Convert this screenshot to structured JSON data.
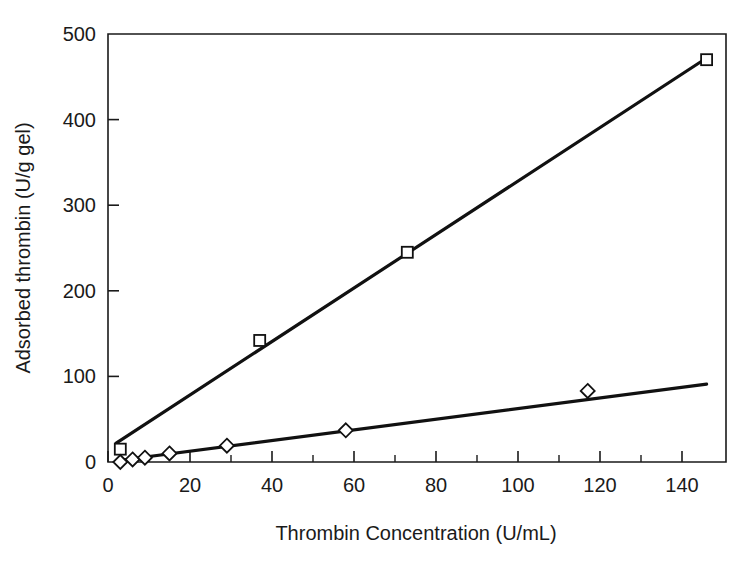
{
  "chart_data": {
    "type": "scatter",
    "title": "",
    "subtitle": "",
    "xlabel": "Thrombin Concentration (U/mL)",
    "ylabel": "Adsorbed thrombin (U/g gel)",
    "xlim": [
      0,
      150
    ],
    "ylim": [
      0,
      500
    ],
    "xticks": [
      0,
      20,
      40,
      60,
      80,
      100,
      120,
      140
    ],
    "yticks": [
      0,
      100,
      200,
      300,
      400,
      500
    ],
    "xtick_labels": [
      "0",
      "20",
      "40",
      "60",
      "80",
      "100",
      "120",
      "140"
    ],
    "ytick_labels": [
      "0",
      "100",
      "200",
      "300",
      "400",
      "500"
    ],
    "x_minor_tick_interval": 10,
    "grid": false,
    "legend": "none",
    "legend_position": "none",
    "annotations": [],
    "series": [
      {
        "name": "square-series",
        "marker": "open-square",
        "color": "#111111",
        "points": [
          {
            "x": 3,
            "y": 15
          },
          {
            "x": 37,
            "y": 142
          },
          {
            "x": 73,
            "y": 245
          },
          {
            "x": 146,
            "y": 470
          }
        ],
        "fit_line": {
          "x1": 2,
          "y1": 22,
          "x2": 146,
          "y2": 472
        }
      },
      {
        "name": "diamond-series",
        "marker": "open-diamond",
        "color": "#111111",
        "points": [
          {
            "x": 3,
            "y": 0
          },
          {
            "x": 6,
            "y": 3
          },
          {
            "x": 9,
            "y": 5
          },
          {
            "x": 15,
            "y": 10
          },
          {
            "x": 29,
            "y": 19
          },
          {
            "x": 58,
            "y": 37
          },
          {
            "x": 117,
            "y": 83
          }
        ],
        "fit_line": {
          "x1": 3,
          "y1": 2,
          "x2": 146,
          "y2": 91
        }
      }
    ]
  },
  "axes": {
    "x_title": "Thrombin Concentration (U/mL)",
    "y_title": "Adsorbed thrombin (U/g gel)"
  }
}
